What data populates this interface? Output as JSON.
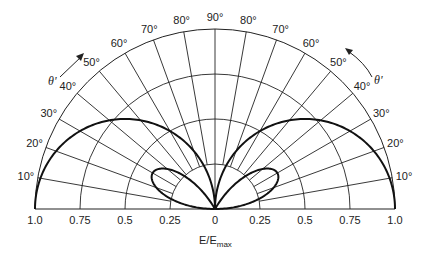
{
  "chart_data": {
    "type": "polar",
    "title": "",
    "xlabel": "E/E_max",
    "xlabel_main": "E/E",
    "xlabel_sub": "max",
    "angle_label": "θ'",
    "center_px": [
      215,
      209
    ],
    "radius_px": 180,
    "radial_ticks": [
      "1.0",
      "0.75",
      "0.5",
      "0.25",
      "0",
      "0.25",
      "0.75",
      "0.5",
      "1.0"
    ],
    "radial_tick_values": [
      -1.0,
      -0.75,
      -0.5,
      -0.25,
      0,
      0.25,
      0.5,
      0.75,
      1.0
    ],
    "radial_tick_labels_ordered": [
      "1.0",
      "0.75",
      "0.5",
      "0.25",
      "0",
      "0.25",
      "0.5",
      "0.75",
      "1.0"
    ],
    "rings": [
      0.25,
      0.5,
      0.75,
      1.0
    ],
    "angle_ticks_deg": [
      10,
      20,
      30,
      40,
      50,
      60,
      70,
      80,
      90
    ],
    "angle_tick_labels": [
      "10°",
      "20°",
      "30°",
      "40°",
      "50°",
      "60°",
      "70°",
      "80°",
      "90°"
    ],
    "grid": true,
    "series": [
      {
        "name": "outer lobe",
        "description": "E/Emax = cos(θ'), symmetric left and right, reaching 1.0 at 0° and 0 at 90°",
        "style": "bold"
      },
      {
        "name": "inner lobe",
        "description": "small loop peaking near θ'=30° at E/Emax ≈ 0.4, returning to 0 at ≈60°",
        "style": "bold"
      }
    ]
  }
}
